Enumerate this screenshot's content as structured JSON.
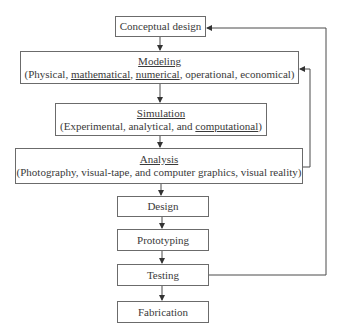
{
  "diagram": {
    "nodes": [
      {
        "id": "conceptual",
        "title": "Conceptual design",
        "underline": false,
        "detail": null
      },
      {
        "id": "modeling",
        "title": "Modeling",
        "underline": true,
        "detail_parts": [
          {
            "text": "(Physical, ",
            "u": false
          },
          {
            "text": "mathematical",
            "u": true
          },
          {
            "text": ", ",
            "u": false
          },
          {
            "text": "numerical",
            "u": true
          },
          {
            "text": ", operational, economical)",
            "u": false
          }
        ]
      },
      {
        "id": "simulation",
        "title": "Simulation",
        "underline": true,
        "detail_parts": [
          {
            "text": "(Experimental, analytical, and ",
            "u": false
          },
          {
            "text": "computational",
            "u": true
          },
          {
            "text": ")",
            "u": false
          }
        ]
      },
      {
        "id": "analysis",
        "title": "Analysis",
        "underline": true,
        "detail_parts": [
          {
            "text": "(Photography, visual-tape, and computer graphics, visual reality)",
            "u": false
          }
        ]
      },
      {
        "id": "design",
        "title": "Design",
        "underline": false,
        "detail": null
      },
      {
        "id": "prototyping",
        "title": "Prototyping",
        "underline": false,
        "detail": null
      },
      {
        "id": "testing",
        "title": "Testing",
        "underline": false,
        "detail": null
      },
      {
        "id": "fabrication",
        "title": "Fabrication",
        "underline": false,
        "detail": null
      }
    ],
    "edges": [
      {
        "from": "conceptual",
        "to": "modeling"
      },
      {
        "from": "modeling",
        "to": "simulation"
      },
      {
        "from": "simulation",
        "to": "analysis"
      },
      {
        "from": "analysis",
        "to": "design"
      },
      {
        "from": "design",
        "to": "prototyping"
      },
      {
        "from": "prototyping",
        "to": "testing"
      },
      {
        "from": "testing",
        "to": "fabrication"
      },
      {
        "from": "analysis",
        "to": "modeling",
        "type": "feedback"
      },
      {
        "from": "testing",
        "to": "conceptual",
        "type": "feedback"
      }
    ],
    "colors": {
      "line": "#4a4a4a",
      "border": "#6b6b6b",
      "text": "#3a3a3a"
    }
  }
}
